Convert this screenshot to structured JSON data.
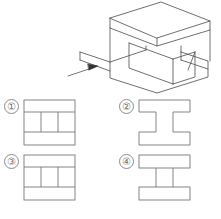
{
  "question": {
    "type": "orthographic-projection-multiple-choice",
    "stroke_color": "#555555",
    "number_color": "#6f6f6f",
    "background_color": "#ffffff"
  },
  "solid": {
    "name": "isometric-i-beam-solid",
    "description": "I-beam shaped solid: square top slab, square bottom slab, central vertical web",
    "view_arrow": {
      "name": "view-direction-arrow",
      "label": "",
      "direction": "lower-left-to-upper-right"
    }
  },
  "options": [
    {
      "id": "1",
      "number": "①",
      "figure": "rectangle-with-two-horizontal-bands-and-two-vertical-lines"
    },
    {
      "id": "2",
      "number": "②",
      "figure": "i-beam-profile-outline"
    },
    {
      "id": "3",
      "number": "③",
      "figure": "rectangle-with-two-side-notches"
    },
    {
      "id": "4",
      "number": "④",
      "figure": "two-bars-joined-by-two-vertical-lines"
    }
  ]
}
